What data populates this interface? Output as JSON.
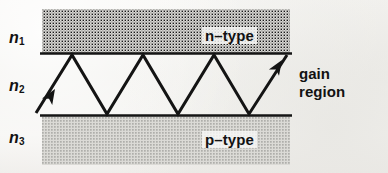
{
  "figure": {
    "width": 388,
    "height": 173,
    "background_color": "#f2f1ee",
    "ink_color": "#121212",
    "shade_color": "#c9c8c4"
  },
  "labels": {
    "n1": {
      "symbol": "n",
      "subscript": "1"
    },
    "n2": {
      "symbol": "n",
      "subscript": "2"
    },
    "n3": {
      "symbol": "n",
      "subscript": "3"
    },
    "n_type": "n–type",
    "p_type": "p–type",
    "gain_region_line1": "gain",
    "gain_region_line2": "region"
  },
  "regions": [
    {
      "name": "n-type-cladding",
      "label": "n–type",
      "refractive_index": "n1",
      "x": 42,
      "y": 9,
      "width": 248,
      "height": 44,
      "fill": "#c9c8c4"
    },
    {
      "name": "active-gain-region",
      "label": "gain region",
      "refractive_index": "n2",
      "x": 42,
      "y": 53,
      "width": 248,
      "height": 63,
      "fill": "none"
    },
    {
      "name": "p-type-cladding",
      "label": "p–type",
      "refractive_index": "n3",
      "x": 42,
      "y": 116,
      "width": 248,
      "height": 49,
      "fill": "#c9c8c4"
    }
  ],
  "boundaries": [
    {
      "name": "upper-interface",
      "x1": 40,
      "y1": 53.5,
      "x2": 292,
      "y2": 53.5
    },
    {
      "name": "lower-interface",
      "x1": 40,
      "y1": 115.5,
      "x2": 292,
      "y2": 115.5
    }
  ],
  "ray": {
    "name": "zigzag-ray-path",
    "description": "Totally internally reflected ray bouncing between the two interfaces",
    "stroke_width": 3,
    "points": [
      {
        "x": 36,
        "y": 113
      },
      {
        "x": 72,
        "y": 55
      },
      {
        "x": 107,
        "y": 114
      },
      {
        "x": 143,
        "y": 55
      },
      {
        "x": 178,
        "y": 114
      },
      {
        "x": 214,
        "y": 55
      },
      {
        "x": 249,
        "y": 114
      },
      {
        "x": 287,
        "y": 55
      }
    ],
    "arrowheads": [
      {
        "name": "input-arrowhead",
        "x": 55,
        "y": 89,
        "angle_deg": -58
      },
      {
        "name": "output-arrowhead",
        "x": 281,
        "y": 62,
        "angle_deg": -58
      }
    ]
  }
}
